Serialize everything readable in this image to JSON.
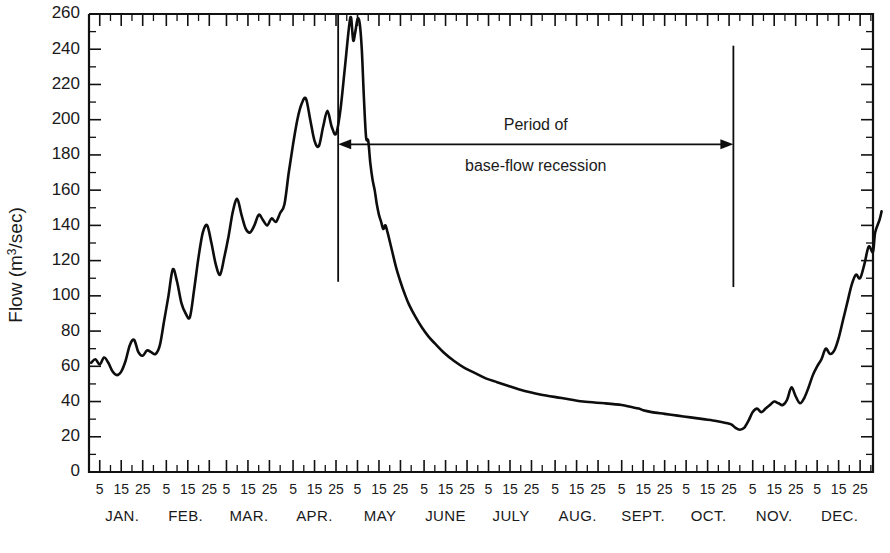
{
  "chart_data": {
    "type": "line",
    "title": "",
    "xlabel": "",
    "ylabel": "Flow (m³/sec)",
    "ylabel_base": "Flow (m",
    "ylabel_sup": "3",
    "ylabel_tail": "/sec)",
    "ylim": [
      0,
      260
    ],
    "ytick_step": 20,
    "yminor_step": 10,
    "grid": false,
    "legend": "none",
    "line_color": "#0d0d0d",
    "xlim_days": [
      0,
      365
    ],
    "yticks": [
      0,
      20,
      40,
      60,
      80,
      100,
      120,
      140,
      160,
      180,
      200,
      220,
      240,
      260
    ],
    "xtick_labels": [
      "5",
      "15",
      "25"
    ],
    "months": [
      {
        "name": "JAN.",
        "days": 31
      },
      {
        "name": "FEB.",
        "days": 28
      },
      {
        "name": "MAR.",
        "days": 31
      },
      {
        "name": "APR.",
        "days": 30
      },
      {
        "name": "MAY",
        "days": 31
      },
      {
        "name": "JUNE",
        "days": 30
      },
      {
        "name": "JULY",
        "days": 31
      },
      {
        "name": "AUG.",
        "days": 31
      },
      {
        "name": "SEPT.",
        "days": 30
      },
      {
        "name": "OCT.",
        "days": 31
      },
      {
        "name": "NOV.",
        "days": 30
      },
      {
        "name": "DEC.",
        "days": 31
      }
    ],
    "series": [
      {
        "name": "Streamflow hydrograph",
        "points": [
          [
            1,
            62
          ],
          [
            3,
            64
          ],
          [
            5,
            61
          ],
          [
            7,
            65
          ],
          [
            9,
            62
          ],
          [
            11,
            57
          ],
          [
            13,
            55
          ],
          [
            15,
            57
          ],
          [
            17,
            63
          ],
          [
            19,
            72
          ],
          [
            21,
            75
          ],
          [
            23,
            68
          ],
          [
            25,
            66
          ],
          [
            27,
            69
          ],
          [
            29,
            68
          ],
          [
            31,
            67
          ],
          [
            33,
            72
          ],
          [
            35,
            86
          ],
          [
            37,
            100
          ],
          [
            39,
            115
          ],
          [
            41,
            108
          ],
          [
            43,
            96
          ],
          [
            45,
            90
          ],
          [
            47,
            88
          ],
          [
            49,
            104
          ],
          [
            51,
            122
          ],
          [
            53,
            136
          ],
          [
            55,
            140
          ],
          [
            57,
            130
          ],
          [
            59,
            118
          ],
          [
            61,
            112
          ],
          [
            63,
            122
          ],
          [
            65,
            134
          ],
          [
            67,
            148
          ],
          [
            69,
            155
          ],
          [
            71,
            146
          ],
          [
            73,
            138
          ],
          [
            75,
            136
          ],
          [
            77,
            140
          ],
          [
            79,
            146
          ],
          [
            81,
            143
          ],
          [
            83,
            140
          ],
          [
            85,
            144
          ],
          [
            87,
            142
          ],
          [
            89,
            147
          ],
          [
            91,
            152
          ],
          [
            93,
            170
          ],
          [
            95,
            186
          ],
          [
            97,
            200
          ],
          [
            99,
            209
          ],
          [
            101,
            212
          ],
          [
            103,
            200
          ],
          [
            105,
            188
          ],
          [
            107,
            185
          ],
          [
            109,
            196
          ],
          [
            111,
            205
          ],
          [
            113,
            196
          ],
          [
            115,
            192
          ],
          [
            117,
            205
          ],
          [
            119,
            228
          ],
          [
            121,
            252
          ],
          [
            122,
            258
          ],
          [
            123,
            245
          ],
          [
            124,
            250
          ],
          [
            125,
            257
          ],
          [
            126,
            255
          ],
          [
            127,
            240
          ],
          [
            128,
            212
          ],
          [
            129,
            190
          ],
          [
            130,
            188
          ],
          [
            131,
            175
          ],
          [
            132,
            166
          ],
          [
            133,
            160
          ],
          [
            134,
            152
          ],
          [
            135,
            146
          ],
          [
            136,
            142
          ],
          [
            137,
            138
          ],
          [
            138,
            140
          ],
          [
            139,
            136
          ],
          [
            141,
            126
          ],
          [
            143,
            116
          ],
          [
            145,
            108
          ],
          [
            147,
            101
          ],
          [
            149,
            95
          ],
          [
            152,
            88
          ],
          [
            155,
            82
          ],
          [
            158,
            77
          ],
          [
            161,
            73
          ],
          [
            165,
            68
          ],
          [
            170,
            63
          ],
          [
            175,
            59
          ],
          [
            180,
            56
          ],
          [
            185,
            53
          ],
          [
            190,
            51
          ],
          [
            195,
            49
          ],
          [
            200,
            47
          ],
          [
            210,
            44
          ],
          [
            220,
            42
          ],
          [
            230,
            40
          ],
          [
            240,
            39
          ],
          [
            248,
            38
          ],
          [
            252,
            37
          ],
          [
            256,
            36
          ],
          [
            258,
            35
          ],
          [
            262,
            34
          ],
          [
            268,
            33
          ],
          [
            274,
            32
          ],
          [
            280,
            31
          ],
          [
            286,
            30
          ],
          [
            292,
            29
          ],
          [
            296,
            28
          ],
          [
            299,
            27
          ],
          [
            301,
            25
          ],
          [
            303,
            24
          ],
          [
            305,
            25
          ],
          [
            307,
            29
          ],
          [
            309,
            34
          ],
          [
            311,
            36
          ],
          [
            313,
            34
          ],
          [
            315,
            36
          ],
          [
            317,
            38
          ],
          [
            319,
            40
          ],
          [
            321,
            39
          ],
          [
            323,
            38
          ],
          [
            325,
            41
          ],
          [
            327,
            48
          ],
          [
            329,
            43
          ],
          [
            331,
            39
          ],
          [
            333,
            42
          ],
          [
            335,
            48
          ],
          [
            337,
            55
          ],
          [
            339,
            60
          ],
          [
            341,
            64
          ],
          [
            343,
            70
          ],
          [
            345,
            67
          ],
          [
            347,
            69
          ],
          [
            349,
            76
          ],
          [
            351,
            86
          ],
          [
            353,
            96
          ],
          [
            355,
            106
          ],
          [
            357,
            112
          ],
          [
            359,
            110
          ],
          [
            361,
            118
          ],
          [
            363,
            128
          ],
          [
            365,
            125
          ],
          [
            366,
            136
          ],
          [
            368,
            143
          ],
          [
            369,
            148
          ]
        ]
      }
    ],
    "markers": [
      {
        "name": "recession-start-marker",
        "day": 116,
        "y_top": 260,
        "y_bottom": 108
      },
      {
        "name": "recession-end-marker",
        "day": 300,
        "y_top": 242,
        "y_bottom": 105
      }
    ],
    "annotations": [
      {
        "name": "period-of-base-flow-recession",
        "line1": "Period of",
        "line2": "base-flow  recession",
        "arrow_from_day": 116,
        "arrow_to_day": 300,
        "arrow_y": 186,
        "double_headed": true
      }
    ]
  }
}
